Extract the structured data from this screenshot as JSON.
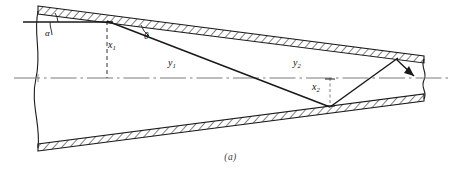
{
  "figure": {
    "caption": "(a)",
    "colors": {
      "line": "#1a1a1a",
      "centerline": "#7a7a7a",
      "hatch": "#1a1a1a",
      "background": "#ffffff",
      "caption_text": "#3b3b3b"
    }
  },
  "labels": {
    "alpha": "α",
    "theta": "θ",
    "x1_base": "x",
    "x1_sub": "1",
    "x2_base": "x",
    "x2_sub": "2",
    "y1_base": "y",
    "y1_sub": "1",
    "y2_base": "y",
    "y2_sub": "2"
  },
  "elements": {
    "top_wall_name": "top-tapered-wall",
    "bottom_wall_name": "bottom-tapered-wall",
    "centerline_name": "axis-centerline",
    "ray_incident_name": "incident-ray-segment",
    "ray_reflected_name": "reflected-ray-segment",
    "left_break_name": "left-break-line",
    "right_break_name": "right-break-line",
    "x1_dim_name": "x1-dimension-line",
    "x2_dim_name": "x2-dimension-line",
    "alpha_arc_name": "alpha-angle-arc",
    "theta_arc_name": "theta-angle-arc",
    "horizontal_ref_name": "upper-horizontal-reference-line",
    "arrowhead_name": "ray-direction-arrowhead"
  },
  "geometry": {
    "width": 461,
    "height": 179,
    "centerline_y": 78,
    "top_wall_left_y": 7,
    "top_wall_right_y": 57,
    "bottom_wall_left_y": 150,
    "bottom_wall_right_y": 100,
    "left_x": 38,
    "right_x": 424
  }
}
